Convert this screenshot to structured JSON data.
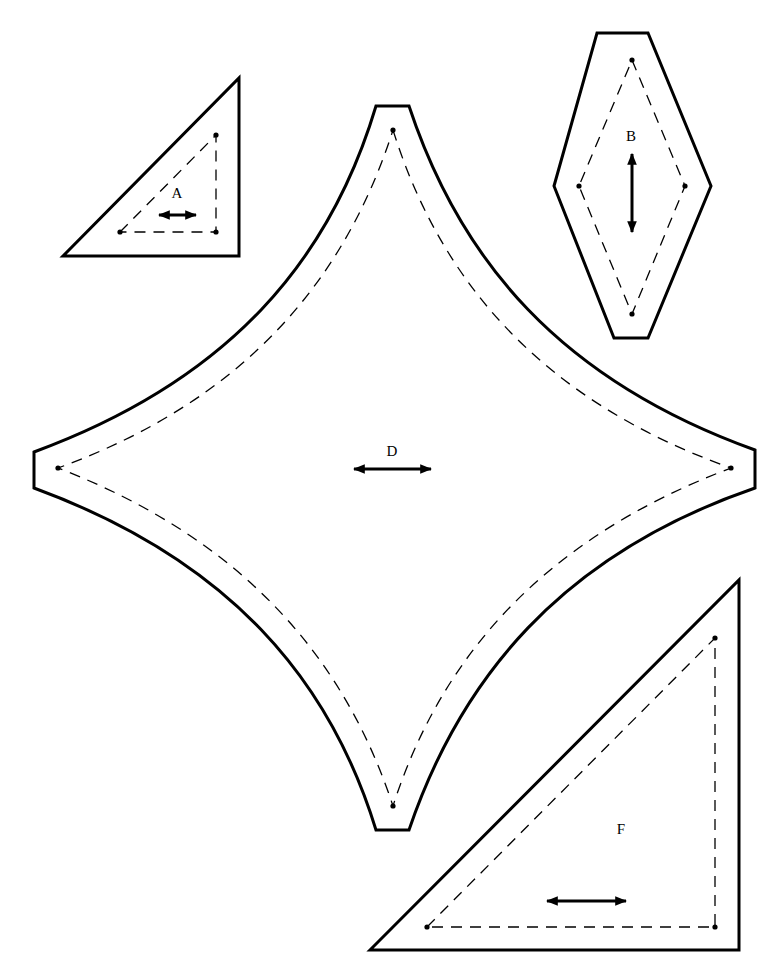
{
  "colors": {
    "line": "#000000",
    "background": "#ffffff"
  },
  "pieces": [
    {
      "id": "A",
      "label": "A",
      "shape": "right triangle",
      "grainline": "horizontal"
    },
    {
      "id": "B",
      "label": "B",
      "shape": "diamond",
      "grainline": "vertical"
    },
    {
      "id": "D",
      "label": "D",
      "shape": "curved four-point star",
      "grainline": "horizontal"
    },
    {
      "id": "F",
      "label": "F",
      "shape": "right triangle",
      "grainline": "horizontal"
    }
  ],
  "legend": {
    "solid_line": "cutting line",
    "dashed_line": "seam line",
    "dot": "seam corner point",
    "double_arrow": "grainline"
  }
}
